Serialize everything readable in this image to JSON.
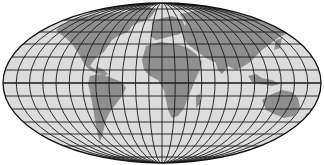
{
  "map": {
    "projection": "Mollweide",
    "title": "World map (Mollweide projection)",
    "graticule": {
      "meridian_spacing_deg": 15,
      "parallel_spacing_deg": 15,
      "equator_emphasized": true
    },
    "colors": {
      "background": "#ffffff",
      "ocean": "#dcdcdc",
      "land": "#8f8f8f",
      "graticule": "#1a1a1a",
      "outline": "#111111"
    },
    "continents": [
      "North America",
      "Greenland",
      "South America",
      "Europe",
      "Africa",
      "Asia",
      "Australia",
      "Antarctica"
    ]
  }
}
